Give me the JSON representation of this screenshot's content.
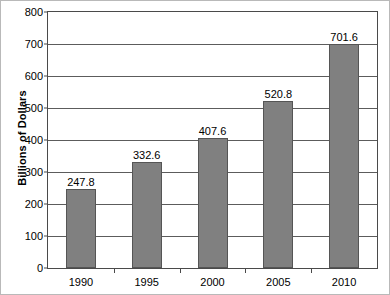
{
  "chart_data": {
    "type": "bar",
    "title": "",
    "subtitle": "",
    "xlabel": "",
    "ylabel": "Billions of Dollars",
    "categories": [
      "1990",
      "1995",
      "2000",
      "2005",
      "2010"
    ],
    "values": [
      247.8,
      332.6,
      407.6,
      520.8,
      701.6
    ],
    "value_labels": [
      "247.8",
      "332.6",
      "407.6",
      "520.8",
      "701.6"
    ],
    "ylim": [
      0,
      800
    ],
    "ytick_values": [
      0,
      100,
      200,
      300,
      400,
      500,
      600,
      700,
      800
    ],
    "ytick_labels": [
      "0",
      "100",
      "200",
      "300",
      "400",
      "500",
      "600",
      "700",
      "800"
    ],
    "grid": true,
    "legend": null,
    "legend_position": "none",
    "bar_color": "#808080",
    "bar_border_color": "#555555",
    "axis_color": "#4a4a4a",
    "grid_color": "#5c5c5c",
    "background_color": "#ffffff",
    "text_color": "#000000"
  }
}
